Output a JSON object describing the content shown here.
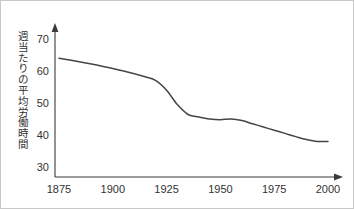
{
  "figure": {
    "title": "",
    "background_color": "#ffffff",
    "border_color": "#c8c8c8",
    "line_color": "#454545",
    "axis_color": "#3a3a3a"
  },
  "chart_data": {
    "type": "line",
    "title": "",
    "xlabel": "",
    "ylabel": "週当たりの平均労働時間",
    "xlim": [
      1875,
      2005
    ],
    "ylim": [
      28,
      73
    ],
    "xticks": [
      1875,
      1900,
      1925,
      1950,
      1975,
      2000
    ],
    "xtick_labels": [
      "1875",
      "1900",
      "1925",
      "1950",
      "1975",
      "2000"
    ],
    "yticks": [
      30,
      40,
      50,
      60,
      70
    ],
    "ytick_labels": [
      "30",
      "40",
      "50",
      "60",
      "70"
    ],
    "grid": false,
    "legend": false,
    "series": [
      {
        "name": "週当たりの平均労働時間",
        "x": [
          1875,
          1885,
          1895,
          1905,
          1915,
          1920,
          1925,
          1930,
          1935,
          1940,
          1945,
          1950,
          1955,
          1960,
          1965,
          1970,
          1975,
          1980,
          1985,
          1990,
          1995,
          2000
        ],
        "values": [
          64.0,
          62.8,
          61.5,
          60.0,
          58.2,
          57.0,
          54.0,
          49.5,
          46.4,
          45.6,
          45.0,
          44.8,
          45.0,
          44.5,
          43.5,
          42.5,
          41.5,
          40.5,
          39.5,
          38.6,
          38.0,
          38.0
        ]
      }
    ]
  },
  "y_axis_label_chars": [
    "週",
    "当",
    "た",
    "り",
    "の",
    "平",
    "均",
    "労",
    "働",
    "時",
    "間"
  ]
}
